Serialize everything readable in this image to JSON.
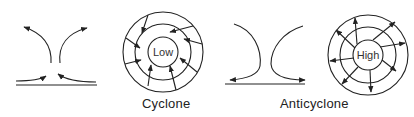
{
  "diagram": {
    "colors": {
      "line": "#222222",
      "background": "#ffffff"
    },
    "panels": [
      {
        "id": "cyclone",
        "caption": "Cyclone",
        "center_label": "Low",
        "side_view": "surface air converges inward and rises, diverging aloft",
        "plan_view": "arrows spiral inward toward low-pressure center"
      },
      {
        "id": "anticyclone",
        "caption": "Anticyclone",
        "center_label": "High",
        "side_view": "air descends and diverges outward at the surface",
        "plan_view": "arrows spiral outward from high-pressure center"
      }
    ]
  }
}
